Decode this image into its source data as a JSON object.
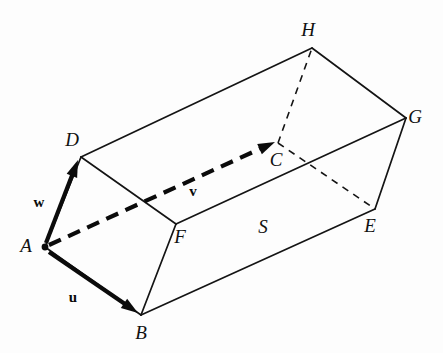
{
  "figure": {
    "kind": "geometry-diagram",
    "background_color": "#fdfdfd",
    "ink_color": "#141414",
    "width": 443,
    "height": 353
  },
  "vertices": [
    {
      "id": "A",
      "label": "A",
      "x": 45,
      "y": 247,
      "label_x": 26,
      "label_y": 252,
      "marked": true
    },
    {
      "id": "B",
      "label": "B",
      "x": 141,
      "y": 315,
      "label_x": 141,
      "label_y": 339,
      "marked": false
    },
    {
      "id": "C",
      "label": "C",
      "x": 278,
      "y": 143,
      "label_x": 276,
      "label_y": 166,
      "marked": false
    },
    {
      "id": "D",
      "label": "D",
      "x": 81,
      "y": 157,
      "label_x": 72,
      "label_y": 146,
      "marked": false
    },
    {
      "id": "E",
      "label": "E",
      "x": 375,
      "y": 209,
      "label_x": 370,
      "label_y": 232,
      "marked": false
    },
    {
      "id": "F",
      "label": "F",
      "x": 176,
      "y": 224,
      "label_x": 180,
      "label_y": 243,
      "marked": false
    },
    {
      "id": "G",
      "label": "G",
      "x": 406,
      "y": 118,
      "label_x": 415,
      "label_y": 123,
      "marked": false
    },
    {
      "id": "H",
      "label": "H",
      "x": 312,
      "y": 48,
      "label_x": 308,
      "label_y": 36,
      "marked": false
    }
  ],
  "edges_solid": [
    {
      "name": "edge-A-B",
      "from": "A",
      "to": "B"
    },
    {
      "name": "edge-A-D",
      "from": "A",
      "to": "D"
    },
    {
      "name": "edge-B-F",
      "from": "B",
      "to": "F"
    },
    {
      "name": "edge-B-E",
      "from": "B",
      "to": "E"
    },
    {
      "name": "edge-D-F",
      "from": "D",
      "to": "F"
    },
    {
      "name": "edge-D-H",
      "from": "D",
      "to": "H"
    },
    {
      "name": "edge-F-G",
      "from": "F",
      "to": "G"
    },
    {
      "name": "edge-E-G",
      "from": "E",
      "to": "G"
    },
    {
      "name": "edge-H-G",
      "from": "H",
      "to": "G"
    }
  ],
  "edges_hidden": [
    {
      "name": "edge-C-H",
      "from": "C",
      "to": "H"
    },
    {
      "name": "edge-C-E",
      "from": "C",
      "to": "E"
    }
  ],
  "vectors": [
    {
      "id": "u",
      "label": "u",
      "style": "solid",
      "from": "A",
      "to": "B",
      "x1": 49,
      "y1": 252,
      "x2": 138,
      "y2": 313,
      "label_x": 73,
      "label_y": 302
    },
    {
      "id": "w",
      "label": "w",
      "style": "solid",
      "from": "A",
      "to": "D",
      "x1": 46,
      "y1": 243,
      "x2": 78,
      "y2": 160,
      "label_x": 39,
      "label_y": 207
    },
    {
      "id": "v",
      "label": "v",
      "style": "dashed",
      "from": "A",
      "to": "C",
      "x1": 49,
      "y1": 245,
      "x2": 275,
      "y2": 142,
      "label_x": 193,
      "label_y": 196
    }
  ],
  "region_labels": [
    {
      "id": "S",
      "label": "S",
      "x": 263,
      "y": 233
    }
  ]
}
